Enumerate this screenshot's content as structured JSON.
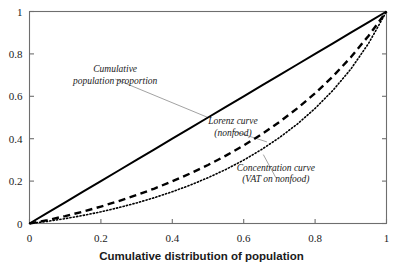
{
  "chart_data": {
    "type": "line",
    "title": "",
    "xlabel": "Cumulative distribution of population",
    "ylabel": "",
    "xlim": [
      0,
      1
    ],
    "ylim": [
      0,
      1
    ],
    "grid": false,
    "legend_position": "inline-annotations",
    "xticks": [
      "0",
      "0.2",
      "0.4",
      "0.6",
      "0.8",
      "1"
    ],
    "xtick_values": [
      0,
      0.2,
      0.4,
      0.6,
      0.8,
      1
    ],
    "yticks": [
      "0",
      "0.2",
      "0.4",
      "0.6",
      "0.8",
      "1"
    ],
    "ytick_values": [
      0,
      0.2,
      0.4,
      0.6,
      0.8,
      1
    ],
    "x": [
      0,
      0.05,
      0.1,
      0.15,
      0.2,
      0.25,
      0.3,
      0.35,
      0.4,
      0.45,
      0.5,
      0.55,
      0.6,
      0.65,
      0.7,
      0.75,
      0.8,
      0.85,
      0.9,
      0.95,
      1
    ],
    "series": [
      {
        "name": "Cumulative population proportion",
        "style": "solid",
        "color": "#000000",
        "values": [
          0,
          0.05,
          0.1,
          0.15,
          0.2,
          0.25,
          0.3,
          0.35,
          0.4,
          0.45,
          0.5,
          0.55,
          0.6,
          0.65,
          0.7,
          0.75,
          0.8,
          0.85,
          0.9,
          0.95,
          1
        ]
      },
      {
        "name": "Lorenz curve (nonfood)",
        "style": "dashed",
        "color": "#000000",
        "values": [
          0,
          0.016,
          0.035,
          0.056,
          0.08,
          0.106,
          0.134,
          0.165,
          0.199,
          0.236,
          0.276,
          0.32,
          0.368,
          0.421,
          0.479,
          0.543,
          0.614,
          0.694,
          0.784,
          0.886,
          1
        ]
      },
      {
        "name": "Concentration curve (VAT on nonfood)",
        "style": "dotted",
        "color": "#000000",
        "values": [
          0,
          0.01,
          0.023,
          0.038,
          0.055,
          0.075,
          0.097,
          0.122,
          0.15,
          0.181,
          0.216,
          0.255,
          0.299,
          0.349,
          0.405,
          0.469,
          0.543,
          0.628,
          0.728,
          0.85,
          1
        ]
      }
    ],
    "annotations": [
      {
        "id": "cumulative-population-proportion",
        "lines": [
          "Cumulative",
          "population proportion"
        ],
        "text_x": 0.24,
        "text_y": 0.7,
        "leader_to_x": 0.5,
        "leader_to_y": 0.5
      },
      {
        "id": "lorenz-curve",
        "lines": [
          "Lorenz curve",
          "(nonfood)"
        ],
        "text_x": 0.57,
        "text_y": 0.455,
        "leader_to_x": 0.665,
        "leader_to_y": 0.385
      },
      {
        "id": "concentration-curve",
        "lines": [
          "Concentration curve",
          "(VAT on nonfood)"
        ],
        "text_x": 0.69,
        "text_y": 0.235,
        "leader_to_x": 0.655,
        "leader_to_y": 0.325
      }
    ]
  },
  "colors": {
    "frame": "#6e6e6e",
    "curve": "#000000",
    "leader": "#8a8a8a",
    "text": "#1a1a1a",
    "background": "#ffffff"
  }
}
